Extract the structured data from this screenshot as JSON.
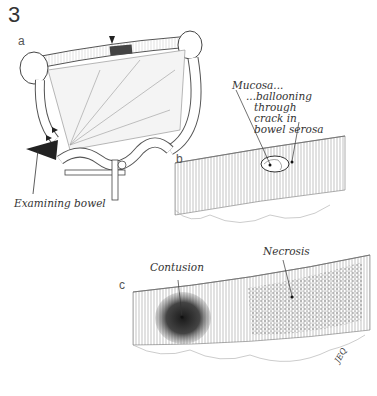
{
  "figure": {
    "number": "3",
    "panels": [
      {
        "letter": "a",
        "labels": [
          "Examining bowel"
        ]
      },
      {
        "letter": "b",
        "labels": [
          "Mucosa...",
          "...ballooning",
          "through",
          "crack in",
          "bowel serosa"
        ]
      },
      {
        "letter": "c",
        "labels": [
          "Contusion",
          "Necrosis"
        ]
      }
    ],
    "signature": "JEQ"
  },
  "colors": {
    "ink": "#333333",
    "shade_dark": "#2a2a2a",
    "shade_mid": "#888888",
    "paper": "#ffffff"
  }
}
